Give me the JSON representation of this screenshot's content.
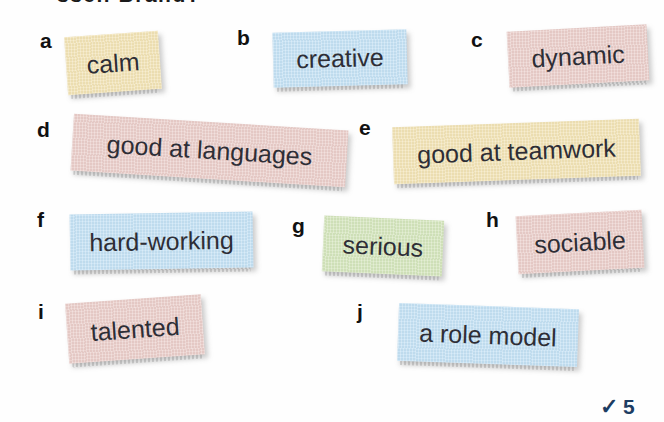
{
  "page": {
    "background": "#fefefe",
    "heading_fragment": "ssell Brand?",
    "heading_note": "clipped at top edge of scan"
  },
  "palette": {
    "yellow": "#f1e2b4",
    "blue": "#c3e0f3",
    "pink": "#e9cdc9",
    "green": "#d3e4bb",
    "tag_text": "#2e2e36",
    "score_navy": "#1d3d63"
  },
  "tags": [
    {
      "letter": "a",
      "text": "calm",
      "bg": "#f1e2b4"
    },
    {
      "letter": "b",
      "text": "creative",
      "bg": "#c3e0f3"
    },
    {
      "letter": "c",
      "text": "dynamic",
      "bg": "#e9cdc9"
    },
    {
      "letter": "d",
      "text": "good at languages",
      "bg": "#e9cdc9"
    },
    {
      "letter": "e",
      "text": "good at teamwork",
      "bg": "#f1e2b4"
    },
    {
      "letter": "f",
      "text": "hard-working",
      "bg": "#c3e0f3"
    },
    {
      "letter": "g",
      "text": "serious",
      "bg": "#d3e4bb"
    },
    {
      "letter": "h",
      "text": "sociable",
      "bg": "#e9cdc9"
    },
    {
      "letter": "i",
      "text": "talented",
      "bg": "#e9cdc9"
    },
    {
      "letter": "j",
      "text": "a role model",
      "bg": "#c3e0f3"
    }
  ],
  "score": {
    "check_icon": "✓",
    "value": "5",
    "color": "#1d3d63"
  }
}
